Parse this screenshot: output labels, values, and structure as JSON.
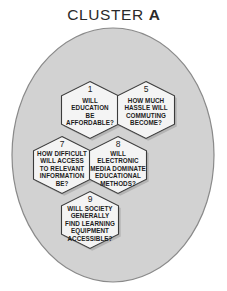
{
  "title": {
    "prefix": "CLUSTER",
    "letter": "A"
  },
  "colors": {
    "oval_fill": "#d2d2d2",
    "oval_stroke": "#8a8a8a",
    "hex_fill": "#f4f4f4",
    "hex_stroke": "#3b3b3b",
    "hex_shadow": "#9a9a9a",
    "text": "#1c1c1c",
    "background": "#ffffff"
  },
  "oval": {
    "cx": 113,
    "cy": 155,
    "rx": 101,
    "ry": 127
  },
  "hexagons": [
    {
      "id": "hex-1",
      "number": "1",
      "lines": [
        "WILL",
        "EDUCATION",
        "BE",
        "AFFORDABLE?"
      ],
      "cx": 90,
      "cy": 110
    },
    {
      "id": "hex-5",
      "number": "5",
      "lines": [
        "HOW MUCH",
        "HASSLE WILL",
        "COMMUTING",
        "BECOME?"
      ],
      "cx": 146,
      "cy": 110
    },
    {
      "id": "hex-7",
      "number": "7",
      "lines": [
        "HOW DIFFICULT",
        "WILL ACCESS",
        "TO RELEVANT",
        "INFORMATION",
        "BE?"
      ],
      "cx": 62,
      "cy": 165
    },
    {
      "id": "hex-8",
      "number": "8",
      "lines": [
        "WILL",
        "ELECTRONIC",
        "MEDIA DOMINATE",
        "EDUCATIONAL",
        "METHODS?"
      ],
      "cx": 118,
      "cy": 165
    },
    {
      "id": "hex-9",
      "number": "9",
      "lines": [
        "WILL SOCIETY",
        "GENERALLY",
        "FIND LEARNING",
        "EQUIPMENT",
        "ACCESSIBLE?"
      ],
      "cx": 90,
      "cy": 220
    }
  ]
}
